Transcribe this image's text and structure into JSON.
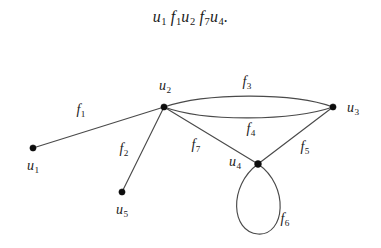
{
  "caption": {
    "full_text": "u1 f1u2 f7u4.",
    "tokens": [
      {
        "base": "u",
        "sub": "1"
      },
      {
        "base": "f",
        "sub": "1"
      },
      {
        "base": "u",
        "sub": "2"
      },
      {
        "base": "f",
        "sub": "7"
      },
      {
        "base": "u",
        "sub": "4"
      }
    ],
    "terminator": "."
  },
  "figure": {
    "kind": "undirected-multigraph",
    "width": 381,
    "height": 248,
    "background_color": "#ffffff",
    "edge_color": "#4a4a4a",
    "vertex_color": "#0d0d0d",
    "vertices": [
      {
        "id": "u1",
        "base": "u",
        "sub": "1",
        "x": 33,
        "y": 148,
        "label_x": 33,
        "label_y": 167
      },
      {
        "id": "u2",
        "base": "u",
        "sub": "2",
        "x": 164,
        "y": 107,
        "label_x": 165,
        "label_y": 87
      },
      {
        "id": "u3",
        "base": "u",
        "sub": "3",
        "x": 333,
        "y": 107,
        "label_x": 353,
        "label_y": 109
      },
      {
        "id": "u4",
        "base": "u",
        "sub": "4",
        "x": 258,
        "y": 164,
        "label_x": 235,
        "label_y": 163
      },
      {
        "id": "u5",
        "base": "u",
        "sub": "5",
        "x": 122,
        "y": 192,
        "label_x": 122,
        "label_y": 211
      }
    ],
    "edges": [
      {
        "id": "f1",
        "base": "f",
        "sub": "1",
        "from": "u1",
        "to": "u2",
        "shape": "straight",
        "label_x": 81,
        "label_y": 111
      },
      {
        "id": "f2",
        "base": "f",
        "sub": "2",
        "from": "u2",
        "to": "u5",
        "shape": "straight",
        "label_x": 124,
        "label_y": 150
      },
      {
        "id": "f3",
        "base": "f",
        "sub": "3",
        "from": "u2",
        "to": "u3",
        "shape": "arc-upper",
        "label_x": 247,
        "label_y": 83
      },
      {
        "id": "f4",
        "base": "f",
        "sub": "4",
        "from": "u2",
        "to": "u3",
        "shape": "arc-lower",
        "label_x": 251,
        "label_y": 130
      },
      {
        "id": "f5",
        "base": "f",
        "sub": "5",
        "from": "u4",
        "to": "u3",
        "shape": "straight",
        "label_x": 305,
        "label_y": 148
      },
      {
        "id": "f6",
        "base": "f",
        "sub": "6",
        "from": "u4",
        "to": "u4",
        "shape": "self-loop",
        "label_x": 285,
        "label_y": 220
      },
      {
        "id": "f7",
        "base": "f",
        "sub": "7",
        "from": "u2",
        "to": "u4",
        "shape": "straight",
        "label_x": 196,
        "label_y": 146
      }
    ],
    "paths": {
      "f1": "M 33 148 L 164 107",
      "f2": "M 164 107 L 122 192",
      "f3": "M 164 107 C 205 93, 292 92, 333 107",
      "f4": "M 164 107 C 205 122, 292 121, 333 107",
      "f5": "M 258 164 L 333 107",
      "f6": "M 258 164 C 228 186, 231 232, 258 234 C 285 236, 290 186, 258 164",
      "f7": "M 164 107 L 258 164"
    }
  }
}
